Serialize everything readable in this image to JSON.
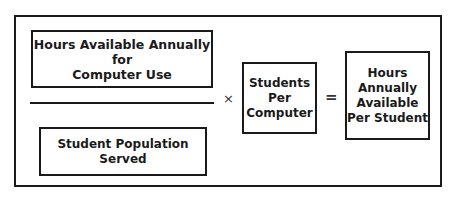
{
  "diagram": {
    "type": "formula",
    "numerator": {
      "label": "Hours Available Annually for\nComputer Use"
    },
    "denominator": {
      "label": "Student Population\nServed"
    },
    "multiply_operator": "×",
    "multiplier": {
      "label": "Students\nPer\nComputer"
    },
    "equals_operator": "=",
    "result": {
      "label": "Hours\nAnnually\nAvailable\nPer Student"
    }
  }
}
